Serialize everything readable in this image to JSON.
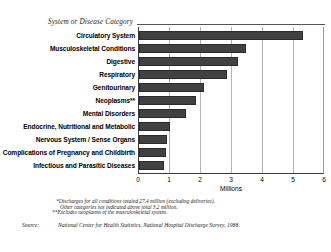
{
  "chart_data": {
    "type": "bar",
    "orientation": "horizontal",
    "title": "",
    "category_axis_title": "System or Disease Category",
    "xlabel": "Millions",
    "ylabel": "",
    "xlim": [
      0,
      6
    ],
    "xticks": [
      0,
      1,
      2,
      3,
      4,
      5,
      6
    ],
    "xticklabels": [
      "0",
      "1",
      "2",
      "3",
      "4",
      "5",
      "6"
    ],
    "grid": "vertical",
    "legend": "none",
    "bar_color": "#414141",
    "categories": [
      "Circulatory System",
      "Musculoskeletal Conditions",
      "Digestive",
      "Respiratory",
      "Genitourinary",
      "Neoplasms**",
      "Mental Disorders",
      "Endocrine, Nutritional and Metabolic",
      "Nervous System / Sense Organs",
      "Complications of Pregnancy and Childbirth",
      "Infectious and Parasitic Diseases"
    ],
    "values": [
      5.3,
      3.45,
      3.2,
      2.85,
      2.1,
      1.85,
      1.5,
      1.0,
      0.9,
      0.87,
      0.8
    ]
  },
  "notes": {
    "footnote_1": "*Discharges for all conditions totaled 27.4 million (excluding deliveries).",
    "footnote_2": "Other categories not indicated above total 3.2 million.",
    "footnote_3": "**Excludes neoplasms of the musculoskeletal system.",
    "source_label": "Source:",
    "source_text": "National Center for Health Statistics, National Hospital Discharge Survey, 1988."
  }
}
